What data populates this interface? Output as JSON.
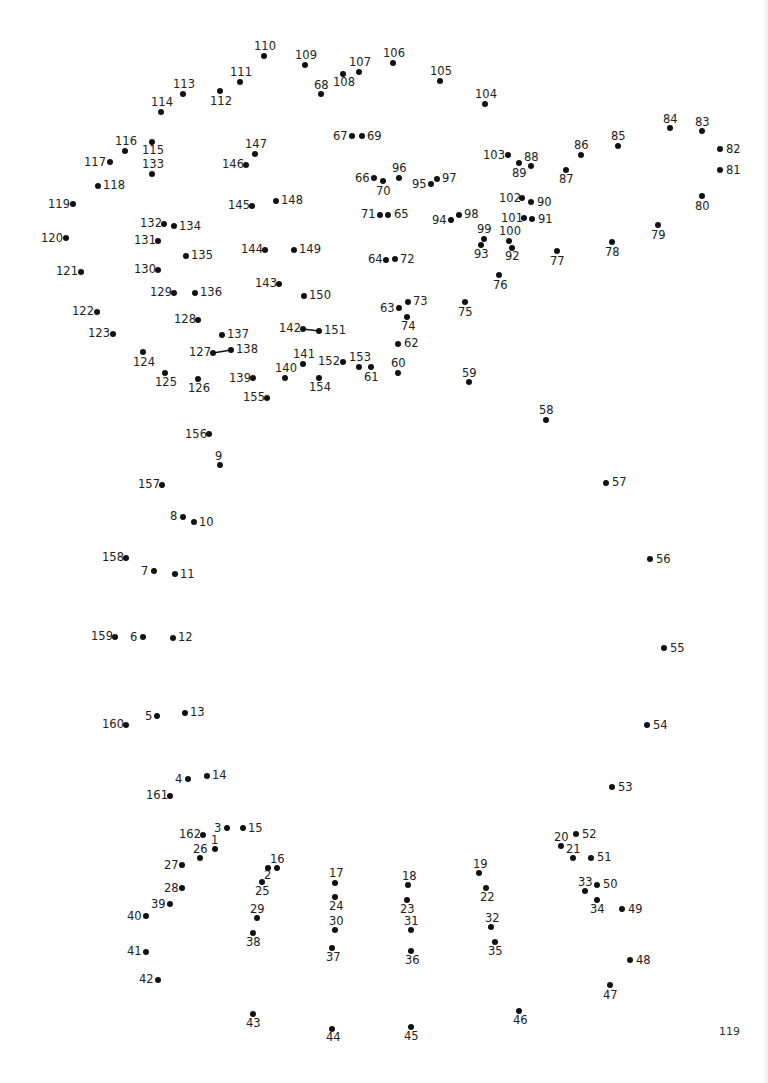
{
  "page": {
    "page_number": "119",
    "background": "#ffffff",
    "dot_color": "#111111"
  },
  "connected_segments": [
    [
      127,
      138
    ],
    [
      142,
      151
    ]
  ],
  "dots": [
    {
      "n": 1,
      "x": 215,
      "y": 849,
      "lx": 211,
      "ly": 835
    },
    {
      "n": 2,
      "x": 268,
      "y": 868,
      "lx": 264,
      "ly": 870
    },
    {
      "n": 3,
      "x": 227,
      "y": 828,
      "lx": 214,
      "ly": 823
    },
    {
      "n": 4,
      "x": 188,
      "y": 779,
      "lx": 175,
      "ly": 774
    },
    {
      "n": 5,
      "x": 157,
      "y": 716,
      "lx": 145,
      "ly": 711
    },
    {
      "n": 6,
      "x": 143,
      "y": 637,
      "lx": 130,
      "ly": 632
    },
    {
      "n": 7,
      "x": 154,
      "y": 571,
      "lx": 141,
      "ly": 566
    },
    {
      "n": 8,
      "x": 183,
      "y": 517,
      "lx": 170,
      "ly": 511
    },
    {
      "n": 9,
      "x": 220,
      "y": 465,
      "lx": 215,
      "ly": 451
    },
    {
      "n": 10,
      "x": 194,
      "y": 522,
      "lx": 199,
      "ly": 517
    },
    {
      "n": 11,
      "x": 175,
      "y": 574,
      "lx": 180,
      "ly": 569
    },
    {
      "n": 12,
      "x": 173,
      "y": 638,
      "lx": 178,
      "ly": 632
    },
    {
      "n": 13,
      "x": 185,
      "y": 713,
      "lx": 190,
      "ly": 707
    },
    {
      "n": 14,
      "x": 207,
      "y": 776,
      "lx": 212,
      "ly": 770
    },
    {
      "n": 15,
      "x": 243,
      "y": 828,
      "lx": 248,
      "ly": 823
    },
    {
      "n": 16,
      "x": 277,
      "y": 868,
      "lx": 270,
      "ly": 854
    },
    {
      "n": 17,
      "x": 335,
      "y": 883,
      "lx": 329,
      "ly": 868
    },
    {
      "n": 18,
      "x": 408,
      "y": 885,
      "lx": 402,
      "ly": 871
    },
    {
      "n": 19,
      "x": 479,
      "y": 873,
      "lx": 473,
      "ly": 859
    },
    {
      "n": 20,
      "x": 561,
      "y": 846,
      "lx": 554,
      "ly": 832
    },
    {
      "n": 21,
      "x": 573,
      "y": 858,
      "lx": 566,
      "ly": 844
    },
    {
      "n": 22,
      "x": 486,
      "y": 888,
      "lx": 480,
      "ly": 892
    },
    {
      "n": 23,
      "x": 407,
      "y": 900,
      "lx": 400,
      "ly": 904
    },
    {
      "n": 24,
      "x": 335,
      "y": 897,
      "lx": 329,
      "ly": 901
    },
    {
      "n": 25,
      "x": 262,
      "y": 882,
      "lx": 255,
      "ly": 886
    },
    {
      "n": 26,
      "x": 200,
      "y": 858,
      "lx": 193,
      "ly": 844
    },
    {
      "n": 27,
      "x": 182,
      "y": 865,
      "lx": 164,
      "ly": 860
    },
    {
      "n": 28,
      "x": 182,
      "y": 888,
      "lx": 164,
      "ly": 883
    },
    {
      "n": 29,
      "x": 257,
      "y": 918,
      "lx": 250,
      "ly": 904
    },
    {
      "n": 30,
      "x": 335,
      "y": 930,
      "lx": 329,
      "ly": 916
    },
    {
      "n": 31,
      "x": 411,
      "y": 930,
      "lx": 404,
      "ly": 916
    },
    {
      "n": 32,
      "x": 491,
      "y": 927,
      "lx": 485,
      "ly": 913
    },
    {
      "n": 33,
      "x": 585,
      "y": 891,
      "lx": 578,
      "ly": 877
    },
    {
      "n": 34,
      "x": 597,
      "y": 900,
      "lx": 590,
      "ly": 904
    },
    {
      "n": 35,
      "x": 495,
      "y": 942,
      "lx": 488,
      "ly": 946
    },
    {
      "n": 36,
      "x": 411,
      "y": 951,
      "lx": 405,
      "ly": 955
    },
    {
      "n": 37,
      "x": 332,
      "y": 948,
      "lx": 326,
      "ly": 952
    },
    {
      "n": 38,
      "x": 253,
      "y": 933,
      "lx": 246,
      "ly": 937
    },
    {
      "n": 39,
      "x": 170,
      "y": 904,
      "lx": 151,
      "ly": 899
    },
    {
      "n": 40,
      "x": 146,
      "y": 916,
      "lx": 127,
      "ly": 911
    },
    {
      "n": 41,
      "x": 146,
      "y": 952,
      "lx": 127,
      "ly": 946
    },
    {
      "n": 42,
      "x": 158,
      "y": 980,
      "lx": 139,
      "ly": 974
    },
    {
      "n": 43,
      "x": 253,
      "y": 1014,
      "lx": 246,
      "ly": 1018
    },
    {
      "n": 44,
      "x": 332,
      "y": 1029,
      "lx": 326,
      "ly": 1032
    },
    {
      "n": 45,
      "x": 411,
      "y": 1027,
      "lx": 404,
      "ly": 1031
    },
    {
      "n": 46,
      "x": 519,
      "y": 1011,
      "lx": 513,
      "ly": 1015
    },
    {
      "n": 47,
      "x": 610,
      "y": 985,
      "lx": 603,
      "ly": 990
    },
    {
      "n": 48,
      "x": 630,
      "y": 960,
      "lx": 636,
      "ly": 955
    },
    {
      "n": 49,
      "x": 622,
      "y": 909,
      "lx": 628,
      "ly": 904
    },
    {
      "n": 50,
      "x": 597,
      "y": 885,
      "lx": 603,
      "ly": 879
    },
    {
      "n": 51,
      "x": 591,
      "y": 858,
      "lx": 597,
      "ly": 852
    },
    {
      "n": 52,
      "x": 576,
      "y": 834,
      "lx": 582,
      "ly": 829
    },
    {
      "n": 53,
      "x": 612,
      "y": 787,
      "lx": 618,
      "ly": 782
    },
    {
      "n": 54,
      "x": 647,
      "y": 725,
      "lx": 653,
      "ly": 720
    },
    {
      "n": 55,
      "x": 664,
      "y": 648,
      "lx": 670,
      "ly": 643
    },
    {
      "n": 56,
      "x": 650,
      "y": 559,
      "lx": 656,
      "ly": 554
    },
    {
      "n": 57,
      "x": 606,
      "y": 483,
      "lx": 612,
      "ly": 477
    },
    {
      "n": 58,
      "x": 546,
      "y": 420,
      "lx": 539,
      "ly": 405
    },
    {
      "n": 59,
      "x": 469,
      "y": 382,
      "lx": 462,
      "ly": 368
    },
    {
      "n": 60,
      "x": 398,
      "y": 373,
      "lx": 391,
      "ly": 358
    },
    {
      "n": 61,
      "x": 371,
      "y": 367,
      "lx": 364,
      "ly": 372
    },
    {
      "n": 62,
      "x": 398,
      "y": 344,
      "lx": 404,
      "ly": 338
    },
    {
      "n": 63,
      "x": 399,
      "y": 308,
      "lx": 380,
      "ly": 303
    },
    {
      "n": 64,
      "x": 386,
      "y": 260,
      "lx": 368,
      "ly": 254
    },
    {
      "n": 65,
      "x": 388,
      "y": 215,
      "lx": 394,
      "ly": 209
    },
    {
      "n": 66,
      "x": 374,
      "y": 178,
      "lx": 355,
      "ly": 173
    },
    {
      "n": 67,
      "x": 352,
      "y": 136,
      "lx": 333,
      "ly": 131
    },
    {
      "n": 68,
      "x": 321,
      "y": 94,
      "lx": 314,
      "ly": 80
    },
    {
      "n": 69,
      "x": 362,
      "y": 136,
      "lx": 367,
      "ly": 131
    },
    {
      "n": 70,
      "x": 383,
      "y": 181,
      "lx": 376,
      "ly": 186
    },
    {
      "n": 71,
      "x": 380,
      "y": 215,
      "lx": 361,
      "ly": 209
    },
    {
      "n": 72,
      "x": 395,
      "y": 259,
      "lx": 400,
      "ly": 254
    },
    {
      "n": 73,
      "x": 408,
      "y": 302,
      "lx": 413,
      "ly": 296
    },
    {
      "n": 74,
      "x": 407,
      "y": 317,
      "lx": 401,
      "ly": 321
    },
    {
      "n": 75,
      "x": 465,
      "y": 302,
      "lx": 458,
      "ly": 307
    },
    {
      "n": 76,
      "x": 499,
      "y": 275,
      "lx": 493,
      "ly": 280
    },
    {
      "n": 77,
      "x": 557,
      "y": 251,
      "lx": 550,
      "ly": 256
    },
    {
      "n": 78,
      "x": 612,
      "y": 242,
      "lx": 605,
      "ly": 247
    },
    {
      "n": 79,
      "x": 658,
      "y": 225,
      "lx": 651,
      "ly": 230
    },
    {
      "n": 80,
      "x": 702,
      "y": 196,
      "lx": 695,
      "ly": 201
    },
    {
      "n": 81,
      "x": 720,
      "y": 170,
      "lx": 726,
      "ly": 165
    },
    {
      "n": 82,
      "x": 720,
      "y": 149,
      "lx": 726,
      "ly": 144
    },
    {
      "n": 83,
      "x": 702,
      "y": 131,
      "lx": 695,
      "ly": 117
    },
    {
      "n": 84,
      "x": 670,
      "y": 128,
      "lx": 663,
      "ly": 114
    },
    {
      "n": 85,
      "x": 618,
      "y": 146,
      "lx": 611,
      "ly": 131
    },
    {
      "n": 86,
      "x": 581,
      "y": 155,
      "lx": 574,
      "ly": 140
    },
    {
      "n": 87,
      "x": 566,
      "y": 170,
      "lx": 559,
      "ly": 174
    },
    {
      "n": 88,
      "x": 531,
      "y": 166,
      "lx": 524,
      "ly": 152
    },
    {
      "n": 89,
      "x": 519,
      "y": 163,
      "lx": 512,
      "ly": 168
    },
    {
      "n": 90,
      "x": 531,
      "y": 202,
      "lx": 537,
      "ly": 197
    },
    {
      "n": 91,
      "x": 532,
      "y": 219,
      "lx": 538,
      "ly": 214
    },
    {
      "n": 92,
      "x": 512,
      "y": 248,
      "lx": 505,
      "ly": 251
    },
    {
      "n": 93,
      "x": 481,
      "y": 245,
      "lx": 474,
      "ly": 249
    },
    {
      "n": 94,
      "x": 451,
      "y": 220,
      "lx": 432,
      "ly": 215
    },
    {
      "n": 95,
      "x": 431,
      "y": 184,
      "lx": 412,
      "ly": 179
    },
    {
      "n": 96,
      "x": 399,
      "y": 178,
      "lx": 392,
      "ly": 163
    },
    {
      "n": 97,
      "x": 437,
      "y": 179,
      "lx": 442,
      "ly": 173
    },
    {
      "n": 98,
      "x": 459,
      "y": 215,
      "lx": 464,
      "ly": 209
    },
    {
      "n": 99,
      "x": 484,
      "y": 239,
      "lx": 477,
      "ly": 224
    },
    {
      "n": 100,
      "x": 509,
      "y": 241,
      "lx": 499,
      "ly": 226
    },
    {
      "n": 101,
      "x": 524,
      "y": 218,
      "lx": 501,
      "ly": 213
    },
    {
      "n": 102,
      "x": 522,
      "y": 198,
      "lx": 499,
      "ly": 193
    },
    {
      "n": 103,
      "x": 508,
      "y": 155,
      "lx": 483,
      "ly": 150
    },
    {
      "n": 104,
      "x": 485,
      "y": 104,
      "lx": 475,
      "ly": 89
    },
    {
      "n": 105,
      "x": 440,
      "y": 81,
      "lx": 430,
      "ly": 66
    },
    {
      "n": 106,
      "x": 393,
      "y": 63,
      "lx": 383,
      "ly": 48
    },
    {
      "n": 107,
      "x": 359,
      "y": 72,
      "lx": 349,
      "ly": 57
    },
    {
      "n": 108,
      "x": 343,
      "y": 74,
      "lx": 333,
      "ly": 77
    },
    {
      "n": 109,
      "x": 305,
      "y": 65,
      "lx": 295,
      "ly": 50
    },
    {
      "n": 110,
      "x": 264,
      "y": 56,
      "lx": 254,
      "ly": 41
    },
    {
      "n": 111,
      "x": 240,
      "y": 82,
      "lx": 230,
      "ly": 67
    },
    {
      "n": 112,
      "x": 220,
      "y": 91,
      "lx": 210,
      "ly": 96
    },
    {
      "n": 113,
      "x": 183,
      "y": 94,
      "lx": 173,
      "ly": 79
    },
    {
      "n": 114,
      "x": 161,
      "y": 112,
      "lx": 151,
      "ly": 97
    },
    {
      "n": 115,
      "x": 152,
      "y": 142,
      "lx": 142,
      "ly": 145
    },
    {
      "n": 116,
      "x": 125,
      "y": 151,
      "lx": 115,
      "ly": 136
    },
    {
      "n": 117,
      "x": 110,
      "y": 162,
      "lx": 84,
      "ly": 157
    },
    {
      "n": 118,
      "x": 98,
      "y": 186,
      "lx": 103,
      "ly": 180
    },
    {
      "n": 119,
      "x": 73,
      "y": 204,
      "lx": 48,
      "ly": 199
    },
    {
      "n": 120,
      "x": 66,
      "y": 238,
      "lx": 41,
      "ly": 233
    },
    {
      "n": 121,
      "x": 81,
      "y": 272,
      "lx": 56,
      "ly": 266
    },
    {
      "n": 122,
      "x": 97,
      "y": 312,
      "lx": 72,
      "ly": 306
    },
    {
      "n": 123,
      "x": 113,
      "y": 334,
      "lx": 88,
      "ly": 328
    },
    {
      "n": 124,
      "x": 143,
      "y": 352,
      "lx": 133,
      "ly": 357
    },
    {
      "n": 125,
      "x": 165,
      "y": 373,
      "lx": 155,
      "ly": 377
    },
    {
      "n": 126,
      "x": 198,
      "y": 379,
      "lx": 188,
      "ly": 383
    },
    {
      "n": 127,
      "x": 213,
      "y": 353,
      "lx": 189,
      "ly": 347
    },
    {
      "n": 128,
      "x": 198,
      "y": 320,
      "lx": 174,
      "ly": 314
    },
    {
      "n": 129,
      "x": 174,
      "y": 293,
      "lx": 150,
      "ly": 287
    },
    {
      "n": 130,
      "x": 158,
      "y": 270,
      "lx": 134,
      "ly": 264
    },
    {
      "n": 131,
      "x": 158,
      "y": 241,
      "lx": 134,
      "ly": 235
    },
    {
      "n": 132,
      "x": 164,
      "y": 224,
      "lx": 140,
      "ly": 218
    },
    {
      "n": 133,
      "x": 152,
      "y": 174,
      "lx": 142,
      "ly": 159
    },
    {
      "n": 134,
      "x": 174,
      "y": 226,
      "lx": 179,
      "ly": 221
    },
    {
      "n": 135,
      "x": 186,
      "y": 256,
      "lx": 191,
      "ly": 250
    },
    {
      "n": 136,
      "x": 195,
      "y": 293,
      "lx": 200,
      "ly": 287
    },
    {
      "n": 137,
      "x": 222,
      "y": 335,
      "lx": 227,
      "ly": 329
    },
    {
      "n": 138,
      "x": 231,
      "y": 350,
      "lx": 236,
      "ly": 344
    },
    {
      "n": 139,
      "x": 253,
      "y": 378,
      "lx": 229,
      "ly": 373
    },
    {
      "n": 140,
      "x": 285,
      "y": 378,
      "lx": 275,
      "ly": 363
    },
    {
      "n": 141,
      "x": 303,
      "y": 364,
      "lx": 293,
      "ly": 349
    },
    {
      "n": 142,
      "x": 303,
      "y": 329,
      "lx": 279,
      "ly": 323
    },
    {
      "n": 143,
      "x": 279,
      "y": 284,
      "lx": 255,
      "ly": 278
    },
    {
      "n": 144,
      "x": 265,
      "y": 250,
      "lx": 241,
      "ly": 244
    },
    {
      "n": 145,
      "x": 252,
      "y": 206,
      "lx": 228,
      "ly": 200
    },
    {
      "n": 146,
      "x": 246,
      "y": 165,
      "lx": 222,
      "ly": 159
    },
    {
      "n": 147,
      "x": 255,
      "y": 154,
      "lx": 245,
      "ly": 139
    },
    {
      "n": 148,
      "x": 276,
      "y": 201,
      "lx": 281,
      "ly": 195
    },
    {
      "n": 149,
      "x": 294,
      "y": 250,
      "lx": 299,
      "ly": 244
    },
    {
      "n": 150,
      "x": 304,
      "y": 296,
      "lx": 309,
      "ly": 290
    },
    {
      "n": 151,
      "x": 319,
      "y": 331,
      "lx": 324,
      "ly": 325
    },
    {
      "n": 152,
      "x": 343,
      "y": 362,
      "lx": 318,
      "ly": 356
    },
    {
      "n": 153,
      "x": 359,
      "y": 367,
      "lx": 349,
      "ly": 352
    },
    {
      "n": 154,
      "x": 319,
      "y": 378,
      "lx": 309,
      "ly": 382
    },
    {
      "n": 155,
      "x": 267,
      "y": 398,
      "lx": 243,
      "ly": 392
    },
    {
      "n": 156,
      "x": 209,
      "y": 434,
      "lx": 185,
      "ly": 429
    },
    {
      "n": 157,
      "x": 162,
      "y": 485,
      "lx": 138,
      "ly": 479
    },
    {
      "n": 158,
      "x": 126,
      "y": 558,
      "lx": 102,
      "ly": 552
    },
    {
      "n": 159,
      "x": 115,
      "y": 637,
      "lx": 91,
      "ly": 631
    },
    {
      "n": 160,
      "x": 126,
      "y": 725,
      "lx": 102,
      "ly": 719
    },
    {
      "n": 161,
      "x": 170,
      "y": 796,
      "lx": 146,
      "ly": 790
    },
    {
      "n": 162,
      "x": 203,
      "y": 835,
      "lx": 179,
      "ly": 829
    }
  ]
}
